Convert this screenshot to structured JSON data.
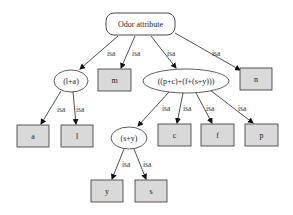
{
  "diagram": {
    "type": "taxonomy-tree",
    "edge_label": "isa",
    "colors": {
      "leaf_fill": "#d9d9d9",
      "inner_fill": "#ffffff",
      "stroke": "#333333"
    },
    "nodes": {
      "root": {
        "label": "Odor attribute",
        "shape": "rounded-rect"
      },
      "la": {
        "label": "(l+a)",
        "shape": "ellipse"
      },
      "m": {
        "label": "m",
        "shape": "box"
      },
      "pcfsy": {
        "label": "((p+c)+(f+(s+y)))",
        "shape": "ellipse"
      },
      "n": {
        "label": "n",
        "shape": "box"
      },
      "a": {
        "label": "a",
        "shape": "box"
      },
      "l": {
        "label": "l",
        "shape": "box"
      },
      "sy": {
        "label": "(s+y)",
        "shape": "ellipse"
      },
      "c": {
        "label": "c",
        "shape": "box"
      },
      "f": {
        "label": "f",
        "shape": "box"
      },
      "p": {
        "label": "p",
        "shape": "box"
      },
      "y": {
        "label": "y",
        "shape": "box"
      },
      "s": {
        "label": "s",
        "shape": "box"
      }
    },
    "edges": [
      {
        "from": "root",
        "to": "la",
        "label": "isa"
      },
      {
        "from": "root",
        "to": "m",
        "label": "isa"
      },
      {
        "from": "root",
        "to": "pcfsy",
        "label": "isa"
      },
      {
        "from": "root",
        "to": "n",
        "label": "isa"
      },
      {
        "from": "la",
        "to": "a",
        "label": "isa"
      },
      {
        "from": "la",
        "to": "l",
        "label": "isa"
      },
      {
        "from": "pcfsy",
        "to": "sy",
        "label": "isa"
      },
      {
        "from": "pcfsy",
        "to": "c",
        "label": "isa"
      },
      {
        "from": "pcfsy",
        "to": "f",
        "label": "isa"
      },
      {
        "from": "pcfsy",
        "to": "p",
        "label": "isa"
      },
      {
        "from": "sy",
        "to": "y",
        "label": "isa"
      },
      {
        "from": "sy",
        "to": "s",
        "label": "isa"
      }
    ]
  }
}
